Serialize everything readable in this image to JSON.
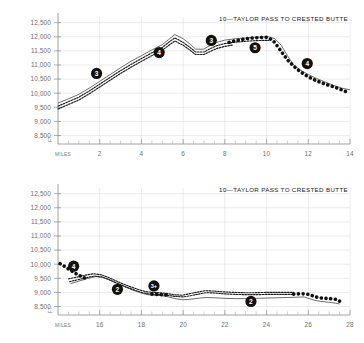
{
  "document": {
    "kind": "elevation-profile-pair",
    "width": 364,
    "height": 343
  },
  "axis": {
    "y_unit": "FT.",
    "x_unit": "MILES"
  },
  "chart_data": [
    {
      "id": "top",
      "type": "line",
      "title": "10—TAYLOR PASS TO CRESTED BUTTE",
      "xlabel": "MILES",
      "ylabel": "FT.",
      "xlim": [
        0,
        14
      ],
      "ylim": [
        8200,
        12700
      ],
      "grid": true,
      "legend": "none",
      "yticks": [
        12500,
        12000,
        11500,
        11000,
        10500,
        10000,
        9500,
        9000,
        8500
      ],
      "ytick_labels": [
        "12,500",
        "12,000",
        "11,500",
        "11,000",
        "10,500",
        "10,000",
        "9,500",
        "9,000",
        "8,500"
      ],
      "xticks": [
        2,
        4,
        6,
        8,
        10,
        12,
        14
      ],
      "xtick_labels": [
        "2",
        "4",
        "6",
        "8",
        "10",
        "12",
        "14"
      ],
      "xticks_minor": [
        0.5,
        1,
        1.5,
        2.5,
        3,
        3.5,
        4.5,
        5,
        5.5,
        6.5,
        7,
        7.5,
        8.5,
        9,
        9.5,
        10.5,
        11,
        11.5,
        12.5,
        13,
        13.5
      ],
      "series": [
        {
          "name": "ridge-upper-solid",
          "style": "solid",
          "x": [
            0.0,
            0.5,
            1.0,
            1.5,
            2.0,
            2.5,
            3.0,
            3.5,
            4.0,
            4.5,
            5.0,
            5.3,
            5.6,
            6.0,
            6.3,
            6.6,
            7.0,
            7.3,
            7.6,
            8.0,
            8.5,
            9.0,
            9.4,
            9.8,
            10.1,
            10.4,
            10.7,
            11.0,
            11.3,
            11.6,
            12.0,
            12.4,
            12.8,
            13.2,
            13.6,
            14.0
          ],
          "y": [
            9650,
            9800,
            9960,
            10180,
            10420,
            10660,
            10900,
            11130,
            11330,
            11530,
            11720,
            11900,
            12080,
            11930,
            11760,
            11560,
            11560,
            11700,
            11800,
            11880,
            11930,
            11960,
            11980,
            12000,
            12000,
            11930,
            11700,
            11330,
            11000,
            10830,
            10660,
            10520,
            10400,
            10280,
            10180,
            10120
          ]
        },
        {
          "name": "ridge-mid-dashed",
          "style": "dashed",
          "x": [
            0.0,
            0.5,
            1.0,
            1.5,
            2.0,
            2.5,
            3.0,
            3.5,
            4.0,
            4.5,
            5.0,
            5.3,
            5.6,
            6.0,
            6.3,
            6.6,
            7.0,
            7.3,
            7.6,
            8.0,
            8.5,
            9.0,
            9.4,
            9.8,
            10.1
          ],
          "y": [
            9540,
            9700,
            9860,
            10080,
            10320,
            10560,
            10800,
            11020,
            11230,
            11430,
            11620,
            11800,
            11960,
            11800,
            11640,
            11460,
            11460,
            11580,
            11680,
            11760,
            11810,
            11840,
            11860,
            11870,
            11870
          ]
        },
        {
          "name": "ridge-lower-dashed",
          "style": "dashed",
          "x": [
            0.0,
            0.5,
            1.0,
            1.5,
            2.0,
            2.5,
            3.0,
            3.5,
            4.0,
            4.5,
            5.0,
            5.3,
            5.6,
            6.0,
            6.3,
            6.6,
            7.0,
            7.3,
            7.6,
            8.0,
            8.4
          ],
          "y": [
            9440,
            9600,
            9760,
            9980,
            10220,
            10460,
            10700,
            10920,
            11130,
            11330,
            11520,
            11690,
            11850,
            11700,
            11540,
            11370,
            11370,
            11480,
            11580,
            11660,
            11710
          ]
        },
        {
          "name": "route-dotted-heavy",
          "style": "dotted",
          "x": [
            8.2,
            8.5,
            8.8,
            9.1,
            9.4,
            9.7,
            10.0,
            10.3,
            10.55,
            10.8,
            11.05,
            11.3,
            11.55,
            11.8,
            12.05,
            12.3,
            12.6,
            12.9,
            13.2,
            13.5,
            13.8
          ],
          "y": [
            11800,
            11860,
            11900,
            11940,
            11960,
            11975,
            11980,
            11880,
            11640,
            11380,
            11140,
            10960,
            10800,
            10670,
            10560,
            10470,
            10380,
            10300,
            10230,
            10150,
            10060
          ]
        }
      ],
      "markers": [
        {
          "label": "3",
          "x": 1.85,
          "y": 10700
        },
        {
          "label": "4",
          "x": 4.85,
          "y": 11440
        },
        {
          "label": "3",
          "x": 7.35,
          "y": 11870
        },
        {
          "label": "5",
          "x": 9.45,
          "y": 11610
        },
        {
          "label": "4",
          "x": 11.95,
          "y": 11050
        }
      ]
    },
    {
      "id": "bottom",
      "type": "line",
      "title": "10—TAYLOR PASS TO CRESTED BUTTE",
      "xlabel": "MILES",
      "ylabel": "FT.",
      "xlim": [
        14,
        28
      ],
      "ylim": [
        8200,
        12700
      ],
      "grid": true,
      "legend": "none",
      "yticks": [
        12500,
        12000,
        11500,
        11000,
        10500,
        10000,
        9500,
        9000,
        8500
      ],
      "ytick_labels": [
        "12,500",
        "12,000",
        "11,500",
        "11,000",
        "10,500",
        "10,000",
        "9,500",
        "9,000",
        "8,500"
      ],
      "xticks": [
        16,
        18,
        20,
        22,
        24,
        26,
        28
      ],
      "xtick_labels": [
        "16",
        "18",
        "20",
        "22",
        "24",
        "26",
        "28"
      ],
      "xticks_minor": [
        14.5,
        15,
        15.5,
        16.5,
        17,
        17.5,
        18.5,
        19,
        19.5,
        20.5,
        21,
        21.5,
        22.5,
        23,
        23.5,
        24.5,
        25,
        25.5,
        26.5,
        27,
        27.5
      ],
      "series": [
        {
          "name": "ridge-upper-solid",
          "style": "solid",
          "x": [
            14.6,
            15.0,
            15.4,
            15.8,
            16.1,
            16.4,
            16.8,
            17.2,
            17.6,
            18.0,
            18.3,
            18.6,
            18.9,
            19.2,
            19.6,
            20.0,
            20.4,
            20.8,
            21.1,
            21.5,
            22.0,
            22.5,
            23.0,
            23.5,
            24.0,
            24.5,
            25.0,
            25.4,
            25.8,
            26.0,
            26.3,
            26.6,
            27.0,
            27.3,
            27.5
          ],
          "y": [
            9310,
            9400,
            9490,
            9560,
            9540,
            9460,
            9330,
            9200,
            9080,
            8980,
            8920,
            8900,
            8890,
            8860,
            8780,
            8740,
            8760,
            8800,
            8820,
            8810,
            8790,
            8780,
            8780,
            8790,
            8800,
            8810,
            8820,
            8830,
            8840,
            8790,
            8720,
            8680,
            8650,
            8620,
            8590
          ]
        },
        {
          "name": "ridge-mid-dashed",
          "style": "dashed",
          "x": [
            14.5,
            14.9,
            15.3,
            15.7,
            16.05,
            16.35,
            16.75,
            17.15,
            17.55,
            17.95,
            18.25,
            18.55,
            18.85,
            19.15,
            19.55,
            19.95,
            20.35,
            20.75,
            21.05,
            21.45,
            21.95,
            22.45,
            22.95,
            23.45,
            23.95,
            24.45,
            24.95,
            25.3
          ],
          "y": [
            9480,
            9540,
            9610,
            9660,
            9630,
            9550,
            9420,
            9290,
            9180,
            9080,
            9020,
            9000,
            8990,
            8970,
            8920,
            8900,
            8960,
            9020,
            9060,
            9050,
            9020,
            9000,
            8990,
            8990,
            9000,
            9000,
            9000,
            9000
          ]
        },
        {
          "name": "ridge-lower-dashed",
          "style": "dashed",
          "x": [
            14.55,
            14.95,
            15.35,
            15.75,
            16.1,
            16.4,
            16.8,
            17.2,
            17.6,
            18.0,
            18.3,
            18.6,
            18.9,
            19.2,
            19.6,
            20.0,
            20.4,
            20.8,
            21.1,
            21.5,
            22.0,
            22.5,
            23.0,
            23.5,
            24.0,
            24.5,
            25.0,
            25.3
          ],
          "y": [
            9380,
            9450,
            9520,
            9580,
            9550,
            9470,
            9340,
            9210,
            9100,
            9000,
            8950,
            8930,
            8920,
            8900,
            8860,
            8840,
            8890,
            8950,
            8990,
            8980,
            8950,
            8930,
            8920,
            8920,
            8930,
            8930,
            8930,
            8930
          ]
        },
        {
          "name": "route-dotted-start",
          "style": "dotted",
          "x": [
            14.1,
            14.3,
            14.5,
            14.7,
            14.9,
            15.1,
            15.3
          ],
          "y": [
            10020,
            9930,
            9830,
            9740,
            9650,
            9570,
            9500
          ]
        },
        {
          "name": "route-dotted-mid",
          "style": "dotted",
          "x": [
            18.5,
            18.75,
            19.0,
            19.2
          ],
          "y": [
            8940,
            8930,
            8920,
            8910
          ]
        },
        {
          "name": "route-dotted-end",
          "style": "dotted",
          "x": [
            25.3,
            25.55,
            25.8,
            26.05,
            26.3,
            26.55,
            26.8,
            27.05,
            27.3,
            27.5
          ],
          "y": [
            8940,
            8950,
            8950,
            8930,
            8850,
            8810,
            8790,
            8780,
            8760,
            8690
          ]
        }
      ],
      "markers": [
        {
          "label": "4",
          "x": 14.75,
          "y": 9930
        },
        {
          "label": "2",
          "x": 16.85,
          "y": 9110
        },
        {
          "label": "3+",
          "x": 18.6,
          "y": 9230
        },
        {
          "label": "2",
          "x": 23.25,
          "y": 8680
        }
      ]
    }
  ]
}
